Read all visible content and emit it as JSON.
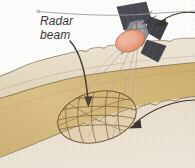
{
  "figure": {
    "kind": "satellite-radar-beam-diagram",
    "labels": {
      "radar_beam_line1": "Radar",
      "radar_beam_line2": "beam"
    },
    "icons": {
      "satellite": "satellite-icon",
      "radar_dish": "radar-dish-icon",
      "solar_panel": "solar-panel-icon",
      "beam_footprint": "beam-footprint-oval-icon",
      "terrain_swath": "terrain-swath-icon",
      "arrow_to_footprint": "curved-arrow-icon",
      "arrow_to_satellite": "callout-arrow-icon",
      "leader_line": "leader-line-icon"
    },
    "colors": {
      "background": "#fbfbf9",
      "terrain_light": "#e9dfc8",
      "terrain_mid": "#e3d6b6",
      "swath_gold": "#d6bb7e",
      "swath_gold_dark": "#c9a961",
      "outline": "#6b5a3e",
      "satellite_panel": "#4a4a52",
      "satellite_panel_dark": "#3a3a42",
      "satellite_body": "#8d8d93",
      "dish_salmon": "#e7a184",
      "label_text": "#3a3a3a",
      "arrow_dark": "#4a4038",
      "leader_gray": "#9a9a96"
    }
  }
}
